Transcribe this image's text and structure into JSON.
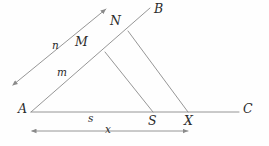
{
  "figure": {
    "kind": "geometry-diagram",
    "colors": {
      "background": "#fefefe",
      "stroke": "#8a8a8a",
      "label": "#2b2b2b"
    },
    "stroke_width": 0.9,
    "labels": [
      {
        "id": "A",
        "text": "A",
        "x": 18,
        "y": 103,
        "class": "label-point"
      },
      {
        "id": "B",
        "text": "B",
        "x": 154,
        "y": 3,
        "class": "label-point"
      },
      {
        "id": "C",
        "text": "C",
        "x": 243,
        "y": 103,
        "class": "label-point"
      },
      {
        "id": "M",
        "text": "M",
        "x": 75,
        "y": 36,
        "class": "label-point"
      },
      {
        "id": "N",
        "text": "N",
        "x": 110,
        "y": 15,
        "class": "label-point"
      },
      {
        "id": "S",
        "text": "S",
        "x": 148,
        "y": 115,
        "class": "label-point"
      },
      {
        "id": "X",
        "text": "X",
        "x": 184,
        "y": 115,
        "class": "label-point"
      },
      {
        "id": "n",
        "text": "n",
        "x": 52,
        "y": 40,
        "class": "label-measure"
      },
      {
        "id": "m",
        "text": "m",
        "x": 57,
        "y": 67,
        "class": "label-measure"
      },
      {
        "id": "s",
        "text": "s",
        "x": 88,
        "y": 113,
        "class": "label-measure"
      },
      {
        "id": "x",
        "text": "x",
        "x": 105,
        "y": 124,
        "class": "label-measure"
      }
    ],
    "points": {
      "A": {
        "x": 31,
        "y": 112
      },
      "C": {
        "x": 239,
        "y": 112
      },
      "M": {
        "x": 105,
        "y": 52
      },
      "N": {
        "x": 128,
        "y": 31
      },
      "S": {
        "x": 153,
        "y": 112
      },
      "X": {
        "x": 188,
        "y": 112
      },
      "B_end": {
        "x": 150,
        "y": 8
      },
      "n_arrow_up": {
        "x": 106,
        "y": 9
      },
      "n_arrow_down": {
        "x": 13,
        "y": 85
      },
      "x_measure_left": {
        "x": 32,
        "y": 131
      },
      "x_measure_right": {
        "x": 188,
        "y": 131
      }
    },
    "segments": [
      {
        "name": "base-line-AC",
        "x1": 31,
        "y1": 112,
        "x2": 239,
        "y2": 112
      },
      {
        "name": "ray-A-to-B",
        "x1": 31,
        "y1": 112,
        "x2": 150,
        "y2": 8
      },
      {
        "name": "cevian-M-to-S",
        "x1": 105,
        "y1": 52,
        "x2": 153,
        "y2": 112
      },
      {
        "name": "cevian-N-to-X",
        "x1": 128,
        "y1": 31,
        "x2": 188,
        "y2": 112
      }
    ],
    "arrow_lines": [
      {
        "name": "ray-n-double-arrow",
        "x1": 13,
        "y1": 85,
        "x2": 106,
        "y2": 9
      },
      {
        "name": "measure-x-double-arrow",
        "x1": 32,
        "y1": 131,
        "x2": 188,
        "y2": 131
      }
    ]
  }
}
